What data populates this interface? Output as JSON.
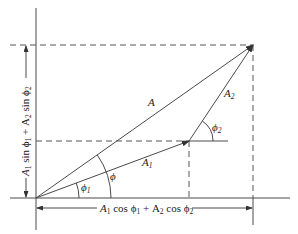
{
  "diagram": {
    "vectors": [
      {
        "name": "A",
        "label": "A",
        "from": [
          36,
          198
        ],
        "to": [
          253,
          45
        ]
      },
      {
        "name": "A1",
        "label": "A",
        "label_sub": "1",
        "from": [
          36,
          198
        ],
        "to": [
          189,
          141
        ]
      },
      {
        "name": "A2",
        "label": "A",
        "label_sub": "2",
        "from": [
          189,
          141
        ],
        "to": [
          253,
          45
        ]
      }
    ],
    "angles": [
      {
        "name": "phi",
        "label": "ϕ"
      },
      {
        "name": "phi1",
        "label": "ϕ",
        "label_sub": "1"
      },
      {
        "name": "phi2",
        "label": "ϕ",
        "label_sub": "2"
      }
    ],
    "dimensions": {
      "horizontal": {
        "part1": "A",
        "sub1": "1",
        "part2": " cos ϕ",
        "sub2": "1",
        "part3": " + A",
        "sub3": "2",
        "part4": " cos ϕ",
        "sub4": "2"
      },
      "vertical": {
        "part1": "A",
        "sub1": "1",
        "part2": " sin ϕ",
        "sub2": "1",
        "part3": " + A",
        "sub3": "2",
        "part4": " sin ϕ",
        "sub4": "2"
      }
    }
  }
}
